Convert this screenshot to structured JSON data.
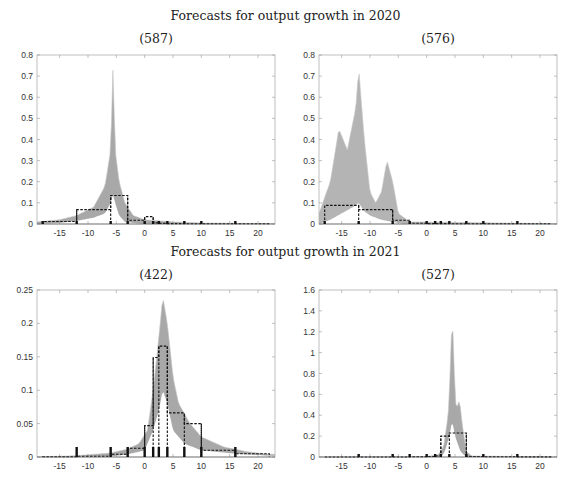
{
  "figure": {
    "row_titles": [
      "Forecasts for output growth in 2020",
      "Forecasts for output growth in 2021"
    ]
  },
  "chart_data": [
    {
      "type": "line",
      "title": "(587)",
      "group": "Forecasts for output growth in 2020",
      "xlabel": "",
      "ylabel": "",
      "xlim": [
        -19,
        23
      ],
      "ylim": [
        0,
        0.8
      ],
      "xticks": [
        -15,
        -10,
        -5,
        0,
        5,
        10,
        15,
        20
      ],
      "yticks": [
        0,
        0.1,
        0.2,
        0.3,
        0.4,
        0.5,
        0.6,
        0.7,
        0.8
      ],
      "grid": false,
      "density_band": {
        "color": "#a8a8a8",
        "upper": [
          [
            -19,
            0.01
          ],
          [
            -15,
            0.02
          ],
          [
            -12,
            0.04
          ],
          [
            -9,
            0.08
          ],
          [
            -7,
            0.18
          ],
          [
            -6,
            0.35
          ],
          [
            -5.6,
            0.74
          ],
          [
            -5.2,
            0.35
          ],
          [
            -4.5,
            0.2
          ],
          [
            -3.5,
            0.1
          ],
          [
            -2,
            0.04
          ],
          [
            0,
            0.02
          ],
          [
            5,
            0.01
          ],
          [
            10,
            0.005
          ],
          [
            22,
            0.002
          ]
        ],
        "lower": [
          [
            -19,
            0.0
          ],
          [
            -15,
            0.005
          ],
          [
            -12,
            0.015
          ],
          [
            -9,
            0.03
          ],
          [
            -7,
            0.05
          ],
          [
            -6,
            0.1
          ],
          [
            -5.6,
            0.14
          ],
          [
            -5.2,
            0.1
          ],
          [
            -4.5,
            0.04
          ],
          [
            -3.5,
            0.01
          ],
          [
            -2,
            0.005
          ],
          [
            0,
            0.0
          ],
          [
            22,
            0.0
          ]
        ]
      },
      "histogram": {
        "bins": [
          -18,
          -12,
          -6,
          -3,
          0,
          1.5,
          2.5,
          4,
          7,
          10,
          16,
          22
        ],
        "values": [
          0.012,
          0.068,
          0.135,
          0.018,
          0.035,
          0.005,
          0.003,
          0.002,
          0.001,
          0.001,
          0.001
        ],
        "style": "dashed"
      },
      "rug_markers": [
        -18,
        -12,
        -6,
        -3,
        0,
        1.5,
        2.5,
        4,
        7,
        10,
        16
      ],
      "rug_heights": [
        0.005,
        0.01,
        0.012,
        0.008,
        0.01,
        0.012,
        0.01,
        0.008,
        0.008,
        0.01,
        0.01
      ]
    },
    {
      "type": "line",
      "title": "(576)",
      "group": "Forecasts for output growth in 2020",
      "xlabel": "",
      "ylabel": "",
      "xlim": [
        -19,
        23
      ],
      "ylim": [
        0,
        0.8
      ],
      "xticks": [
        -15,
        -10,
        -5,
        0,
        5,
        10,
        15,
        20
      ],
      "yticks": [
        0,
        0.1,
        0.2,
        0.3,
        0.4,
        0.5,
        0.6,
        0.7,
        0.8
      ],
      "grid": false,
      "density_band": {
        "color": "#b4b4b4",
        "upper": [
          [
            -19,
            0.05
          ],
          [
            -17,
            0.2
          ],
          [
            -15.5,
            0.45
          ],
          [
            -14,
            0.35
          ],
          [
            -12.5,
            0.55
          ],
          [
            -12,
            0.74
          ],
          [
            -11,
            0.4
          ],
          [
            -10,
            0.15
          ],
          [
            -9,
            0.1
          ],
          [
            -8,
            0.15
          ],
          [
            -7,
            0.3
          ],
          [
            -6,
            0.2
          ],
          [
            -5,
            0.05
          ],
          [
            -3,
            0.01
          ],
          [
            22,
            0.002
          ]
        ],
        "lower": [
          [
            -19,
            0.0
          ],
          [
            -17,
            0.02
          ],
          [
            -15,
            0.05
          ],
          [
            -13,
            0.08
          ],
          [
            -12,
            0.1
          ],
          [
            -11,
            0.06
          ],
          [
            -10,
            0.04
          ],
          [
            -8,
            0.02
          ],
          [
            -6,
            0.01
          ],
          [
            -4,
            0.0
          ],
          [
            22,
            0.0
          ]
        ]
      },
      "histogram": {
        "bins": [
          -18,
          -12,
          -6,
          -3,
          0,
          1.5,
          2.5,
          4,
          7,
          10,
          16,
          22
        ],
        "values": [
          0.088,
          0.068,
          0.018,
          0.004,
          0.002,
          0.002,
          0.002,
          0.001,
          0.001,
          0.001,
          0.001
        ],
        "style": "dashed"
      },
      "rug_markers": [
        -18,
        -12,
        -6,
        -3,
        0,
        1.5,
        2.5,
        4,
        7,
        10,
        16
      ],
      "rug_heights": [
        0.005,
        0.012,
        0.008,
        0.01,
        0.01,
        0.012,
        0.012,
        0.012,
        0.012,
        0.012,
        0.012
      ]
    },
    {
      "type": "line",
      "title": "(422)",
      "group": "Forecasts for output growth in 2021",
      "xlabel": "",
      "ylabel": "",
      "xlim": [
        -19,
        23
      ],
      "ylim": [
        0,
        0.25
      ],
      "xticks": [
        -15,
        -10,
        -5,
        0,
        5,
        10,
        15,
        20
      ],
      "yticks": [
        0,
        0.05,
        0.1,
        0.15,
        0.2,
        0.25
      ],
      "grid": false,
      "density_band": {
        "color": "#a8a8a8",
        "upper": [
          [
            -19,
            0.0
          ],
          [
            -12,
            0.002
          ],
          [
            -6,
            0.006
          ],
          [
            -3,
            0.012
          ],
          [
            -1,
            0.02
          ],
          [
            0.5,
            0.04
          ],
          [
            1.5,
            0.1
          ],
          [
            2.5,
            0.18
          ],
          [
            3.2,
            0.24
          ],
          [
            4,
            0.2
          ],
          [
            5,
            0.12
          ],
          [
            6,
            0.08
          ],
          [
            8,
            0.05
          ],
          [
            10,
            0.03
          ],
          [
            14,
            0.015
          ],
          [
            18,
            0.008
          ],
          [
            22,
            0.004
          ]
        ],
        "lower": [
          [
            -19,
            0.0
          ],
          [
            -6,
            0.001
          ],
          [
            -3,
            0.004
          ],
          [
            0,
            0.01
          ],
          [
            1.5,
            0.04
          ],
          [
            2.5,
            0.07
          ],
          [
            3.2,
            0.1
          ],
          [
            4,
            0.08
          ],
          [
            5,
            0.04
          ],
          [
            7,
            0.02
          ],
          [
            10,
            0.01
          ],
          [
            16,
            0.005
          ],
          [
            22,
            0.002
          ]
        ]
      },
      "histogram": {
        "bins": [
          -18,
          -12,
          -6,
          -3,
          0,
          1.5,
          2.5,
          4,
          7,
          10,
          16,
          22
        ],
        "values": [
          0.0005,
          0.001,
          0.004,
          0.013,
          0.047,
          0.149,
          0.166,
          0.066,
          0.05,
          0.01,
          0.005
        ],
        "style": "dashed"
      },
      "rug_markers": [
        -12,
        -6,
        -3,
        0,
        1.5,
        2.5,
        4,
        7,
        10,
        16
      ],
      "rug_heights": [
        0.015,
        0.015,
        0.015,
        0.015,
        0.015,
        0.015,
        0.015,
        0.015,
        0.015,
        0.015
      ]
    },
    {
      "type": "line",
      "title": "(527)",
      "group": "Forecasts for output growth in 2021",
      "xlabel": "",
      "ylabel": "",
      "xlim": [
        -19,
        23
      ],
      "ylim": [
        0,
        1.6
      ],
      "xticks": [
        -15,
        -10,
        -5,
        0,
        5,
        10,
        15,
        20
      ],
      "yticks": [
        0,
        0.2,
        0.4,
        0.6,
        0.8,
        1,
        1.2,
        1.4,
        1.6
      ],
      "grid": false,
      "density_band": {
        "color": "#a8a8a8",
        "upper": [
          [
            -19,
            0.0
          ],
          [
            0,
            0.005
          ],
          [
            2,
            0.02
          ],
          [
            3,
            0.1
          ],
          [
            3.8,
            0.4
          ],
          [
            4.3,
            1.0
          ],
          [
            4.5,
            1.55
          ],
          [
            4.7,
            1.0
          ],
          [
            5.2,
            0.45
          ],
          [
            5.8,
            0.55
          ],
          [
            6.3,
            0.3
          ],
          [
            7,
            0.05
          ],
          [
            8,
            0.01
          ],
          [
            22,
            0.0
          ]
        ],
        "lower": [
          [
            -19,
            0.0
          ],
          [
            2.5,
            0.0
          ],
          [
            3.2,
            0.05
          ],
          [
            4,
            0.2
          ],
          [
            4.5,
            0.35
          ],
          [
            5,
            0.2
          ],
          [
            6,
            0.05
          ],
          [
            7,
            0.0
          ],
          [
            22,
            0.0
          ]
        ]
      },
      "histogram": {
        "bins": [
          -18,
          -12,
          -6,
          -3,
          0,
          1.5,
          2.5,
          4,
          7,
          10,
          16,
          22
        ],
        "values": [
          0.0,
          0.0,
          0.0,
          0.002,
          0.005,
          0.01,
          0.2,
          0.23,
          0.005,
          0.002,
          0.001
        ],
        "style": "dashed"
      },
      "rug_markers": [
        -12,
        -6,
        -3,
        0,
        1.5,
        2.5,
        4,
        7,
        10,
        16
      ],
      "rug_heights": [
        0.02,
        0.02,
        0.02,
        0.02,
        0.02,
        0.02,
        0.02,
        0.02,
        0.02,
        0.02
      ]
    }
  ],
  "layout": {
    "panels": [
      {
        "left": 37,
        "right": 275,
        "top": 55,
        "bottom": 224,
        "title_x": 156,
        "title_y": 32
      },
      {
        "left": 319,
        "right": 557,
        "top": 55,
        "bottom": 224,
        "title_x": 438,
        "title_y": 32
      },
      {
        "left": 37,
        "right": 275,
        "top": 290,
        "bottom": 457,
        "title_x": 156,
        "title_y": 268
      },
      {
        "left": 319,
        "right": 557,
        "top": 290,
        "bottom": 457,
        "title_x": 438,
        "title_y": 268
      }
    ],
    "row_title_y": [
      8,
      244
    ]
  }
}
